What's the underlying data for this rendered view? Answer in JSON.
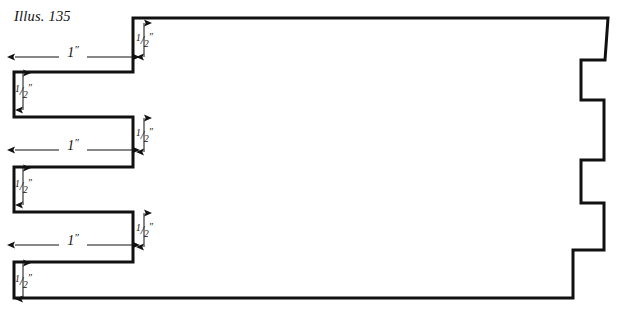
{
  "figure": {
    "caption": "Illus. 135",
    "caption_x": 14,
    "caption_y": 8,
    "stroke_color": "#111111",
    "background_color": "#ffffff",
    "line_width": 3.0,
    "thin_line_width": 1.0
  },
  "dimensions": {
    "width_label": "1″",
    "height_label": "½″",
    "width_numerator": "1",
    "half_numerator": "1",
    "half_denominator": "2",
    "prime": "″",
    "slash": "/"
  },
  "horizontal_dimensions": [
    {
      "name": "slot-width-top",
      "label": "1″",
      "x1": 14,
      "x2": 133,
      "y": 57,
      "text_x": 73,
      "text_y": 45
    },
    {
      "name": "slot-width-middle",
      "label": "1″",
      "x1": 14,
      "x2": 133,
      "y": 150,
      "text_x": 73,
      "text_y": 138
    },
    {
      "name": "slot-width-bottom",
      "label": "1″",
      "x1": 14,
      "x2": 133,
      "y": 245,
      "text_x": 73,
      "text_y": 233
    }
  ],
  "vertical_dimensions": [
    {
      "name": "tooth-gap-top-right",
      "label": "½″",
      "x": 144,
      "y1": 22,
      "y2": 58,
      "text_x": 136,
      "text_y": 32
    },
    {
      "name": "slot-height-top-left",
      "label": "½″",
      "x": 23,
      "y1": 72,
      "y2": 111,
      "text_x": 15,
      "text_y": 83
    },
    {
      "name": "tooth-gap-mid-right",
      "label": "½″",
      "x": 144,
      "y1": 117,
      "y2": 153,
      "text_x": 136,
      "text_y": 127
    },
    {
      "name": "slot-height-mid-left",
      "label": "½″",
      "x": 23,
      "y1": 167,
      "y2": 206,
      "text_x": 15,
      "text_y": 178
    },
    {
      "name": "tooth-gap-bot-right",
      "label": "½″",
      "x": 144,
      "y1": 212,
      "y2": 248,
      "text_x": 136,
      "text_y": 222
    },
    {
      "name": "slot-height-bot-left",
      "label": "½″",
      "x": 23,
      "y1": 262,
      "y2": 300,
      "text_x": 15,
      "text_y": 273
    }
  ],
  "outline": {
    "description": "comb-shaped workpiece outline",
    "path": "M 133 18 L 608 18 L 605 60 L 581 60 L 581 100 L 604 100 L 604 160 L 581 160 L 581 203 L 604 203 L 604 250 L 573 250 L 573 298 L 14 298 L 14 262 L 133 262 L 133 212 L 14 212 L 14 167 L 133 167 L 133 117 L 14 117 L 14 72 L 133 72 Z"
  },
  "right_notches": [
    {
      "name": "notch-1",
      "x_in": 581,
      "x_out": 605,
      "y_top": 60,
      "y_bottom": 100
    },
    {
      "name": "notch-2",
      "x_in": 581,
      "x_out": 604,
      "y_top": 160,
      "y_bottom": 203
    }
  ],
  "left_slots": [
    {
      "name": "slot-1",
      "x_left": 14,
      "x_right": 133,
      "y_top": 72,
      "y_bottom": 117
    },
    {
      "name": "slot-2",
      "x_left": 14,
      "x_right": 133,
      "y_top": 167,
      "y_bottom": 212
    },
    {
      "name": "slot-3",
      "x_left": 14,
      "x_right": 133,
      "y_top": 262,
      "y_bottom": 298
    }
  ]
}
